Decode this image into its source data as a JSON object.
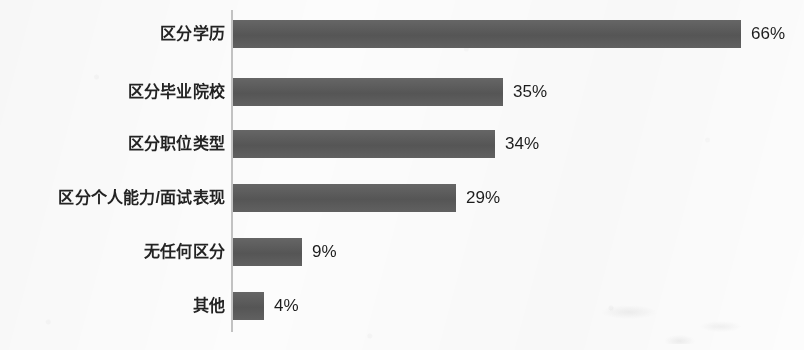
{
  "chart_data": {
    "type": "bar",
    "orientation": "horizontal",
    "title": "",
    "subtitle": "",
    "xlabel": "",
    "ylabel": "",
    "xlim": [
      0,
      70
    ],
    "grid": false,
    "legend": false,
    "value_suffix": "%",
    "categories": [
      "区分学历",
      "区分毕业院校",
      "区分职位类型",
      "区分个人能力/面试表现",
      "无任何区分",
      "其他"
    ],
    "values": [
      66,
      35,
      34,
      29,
      9,
      4
    ],
    "value_labels": [
      "66%",
      "35%",
      "34%",
      "29%",
      "9%",
      "4%"
    ],
    "series": [
      {
        "name": "",
        "values": [
          66,
          35,
          34,
          29,
          9,
          4
        ]
      }
    ]
  },
  "style": {
    "bar_color": "#5a5a5a",
    "axis_color": "#c2c2c2",
    "background_color": "#fcfcfc",
    "label_color": "#232323",
    "value_color": "#1d1d1d"
  },
  "geometry": {
    "axis_x": 231,
    "bar_start_x": 233,
    "px_per_percent": 7.7,
    "bar_height": 28,
    "row_tops": [
      20,
      78,
      130,
      184,
      238,
      292
    ],
    "label_right_edge": 225,
    "value_gap": 10
  }
}
